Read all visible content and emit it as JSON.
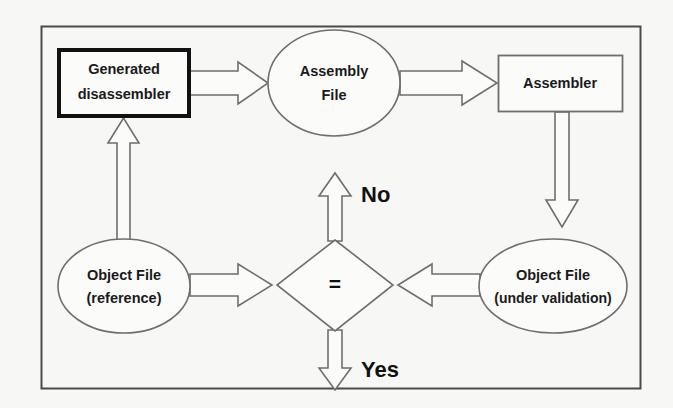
{
  "figure": {
    "background_color": "#f7f7f5",
    "frame_color": "#4a4a4a",
    "shape_stroke_color": "#6e6e6e",
    "emphasis_stroke_color": "#111111",
    "text_color": "#1a1a1a",
    "shape_fill": "#fbfbfa"
  },
  "nodes": {
    "generated_disassembler": {
      "label_line1": "Generated",
      "label_line2": "disassembler",
      "shape": "rectangle-bold"
    },
    "assembly_file": {
      "label_line1": "Assembly",
      "label_line2": "File",
      "shape": "ellipse"
    },
    "assembler": {
      "label_line1": "Assembler",
      "shape": "rectangle"
    },
    "object_file_reference": {
      "label_line1": "Object File",
      "label_line2": "(reference)",
      "shape": "ellipse"
    },
    "object_file_under_validation": {
      "label_line1": "Object File",
      "label_line2": "(under validation)",
      "shape": "ellipse"
    },
    "comparison": {
      "label_line1": "=",
      "shape": "diamond"
    }
  },
  "branches": {
    "no_label": "No",
    "yes_label": "Yes"
  },
  "edges": [
    {
      "name": "disassembler-to-assembly-file",
      "direction": "right"
    },
    {
      "name": "assembly-file-to-assembler",
      "direction": "right"
    },
    {
      "name": "assembler-to-object-file-under-validation",
      "direction": "down"
    },
    {
      "name": "object-file-reference-to-disassembler",
      "direction": "up"
    },
    {
      "name": "object-file-reference-to-comparison",
      "direction": "right"
    },
    {
      "name": "object-file-under-validation-to-comparison",
      "direction": "left"
    },
    {
      "name": "comparison-no-branch",
      "direction": "up"
    },
    {
      "name": "comparison-yes-branch",
      "direction": "down"
    }
  ]
}
